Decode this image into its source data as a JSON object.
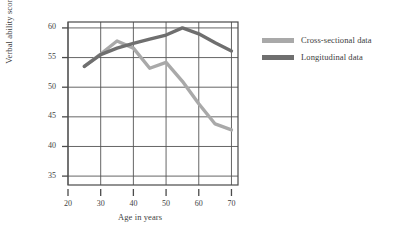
{
  "chart_data": {
    "type": "line",
    "title": "",
    "xlabel": "Age in years",
    "ylabel": "Verbal ability scores",
    "xlim": [
      20,
      72
    ],
    "ylim": [
      33.5,
      61
    ],
    "xticks": [
      20,
      30,
      40,
      50,
      60,
      70
    ],
    "yticks": [
      35,
      40,
      45,
      50,
      55,
      60
    ],
    "grid": true,
    "legend_position": "right",
    "series": [
      {
        "name": "Cross-sectional data",
        "color": "#a9a9a9",
        "x": [
          25,
          30,
          35,
          40,
          45,
          50,
          55,
          60,
          65,
          70
        ],
        "y": [
          53.5,
          55.6,
          57.8,
          56.6,
          53.2,
          54.2,
          51.0,
          47.2,
          43.8,
          42.8
        ]
      },
      {
        "name": "Longitudinal data",
        "color": "#6f6f6f",
        "x": [
          25,
          30,
          35,
          40,
          45,
          50,
          55,
          60,
          65,
          70
        ],
        "y": [
          53.5,
          55.5,
          56.6,
          57.4,
          58.1,
          58.8,
          60.0,
          59.0,
          57.5,
          56.1
        ]
      }
    ]
  },
  "legend": {
    "items": [
      {
        "label": "Cross-sectional data",
        "color": "#a9a9a9"
      },
      {
        "label": "Longitudinal data",
        "color": "#6f6f6f"
      }
    ]
  },
  "axes": {
    "y_tick_labels": [
      "60",
      "55",
      "50",
      "45",
      "40",
      "35"
    ],
    "x_tick_labels": [
      "20",
      "30",
      "40",
      "50",
      "60",
      "70"
    ],
    "x_title": "Age in years",
    "y_title": "Verbal ability scores"
  }
}
